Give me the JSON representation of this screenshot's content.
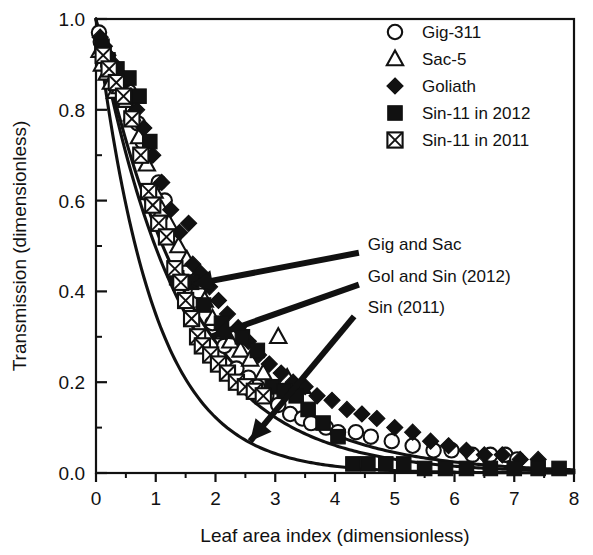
{
  "chart_data": {
    "type": "scatter",
    "title": "",
    "xlabel": "Leaf area index (dimensionless)",
    "ylabel": "Transmission (dimensionless)",
    "xlim": [
      0,
      8
    ],
    "ylim": [
      0.0,
      1.0
    ],
    "xticks": [
      0,
      1,
      2,
      3,
      4,
      5,
      6,
      7,
      8
    ],
    "xtick_labels": [
      "0",
      "1",
      "2",
      "3",
      "4",
      "5",
      "6",
      "7",
      "8"
    ],
    "yticks": [
      0.0,
      0.2,
      0.4,
      0.6,
      0.8,
      1.0
    ],
    "ytick_labels": [
      "0.0",
      "0.2",
      "0.4",
      "0.6",
      "0.8",
      "1.0"
    ],
    "x_minor_interval": 0.5,
    "y_minor_interval": 0.1,
    "grid": false,
    "legend_position": "top-right",
    "series": [
      {
        "name": "Gig-311",
        "marker": "open-circle",
        "points": [
          [
            0.05,
            0.97
          ],
          [
            0.08,
            0.95
          ],
          [
            0.12,
            0.93
          ],
          [
            0.15,
            0.91
          ],
          [
            0.22,
            0.89
          ],
          [
            0.28,
            0.88
          ],
          [
            0.35,
            0.86
          ],
          [
            0.42,
            0.87
          ],
          [
            0.55,
            0.84
          ],
          [
            0.62,
            0.8
          ],
          [
            0.7,
            0.77
          ],
          [
            0.78,
            0.73
          ],
          [
            0.88,
            0.7
          ],
          [
            1.05,
            0.64
          ],
          [
            1.15,
            0.6
          ],
          [
            1.3,
            0.52
          ],
          [
            1.55,
            0.45
          ],
          [
            1.72,
            0.4
          ],
          [
            1.95,
            0.33
          ],
          [
            2.15,
            0.28
          ],
          [
            2.35,
            0.23
          ],
          [
            2.55,
            0.21
          ],
          [
            2.7,
            0.19
          ],
          [
            2.85,
            0.17
          ],
          [
            3.05,
            0.15
          ],
          [
            3.25,
            0.13
          ],
          [
            3.45,
            0.12
          ],
          [
            3.6,
            0.11
          ],
          [
            3.85,
            0.1
          ],
          [
            4.05,
            0.09
          ],
          [
            4.35,
            0.09
          ],
          [
            4.6,
            0.08
          ],
          [
            4.95,
            0.07
          ],
          [
            5.3,
            0.06
          ],
          [
            5.65,
            0.05
          ],
          [
            5.95,
            0.05
          ],
          [
            6.3,
            0.04
          ],
          [
            6.6,
            0.04
          ],
          [
            6.85,
            0.04
          ],
          [
            7.05,
            0.03
          ]
        ]
      },
      {
        "name": "Sac-5",
        "marker": "open-triangle",
        "points": [
          [
            0.06,
            0.93
          ],
          [
            0.1,
            0.9
          ],
          [
            0.18,
            0.88
          ],
          [
            0.25,
            0.86
          ],
          [
            0.32,
            0.84
          ],
          [
            0.4,
            0.85
          ],
          [
            0.5,
            0.82
          ],
          [
            0.6,
            0.79
          ],
          [
            0.72,
            0.74
          ],
          [
            0.85,
            0.68
          ],
          [
            0.98,
            0.62
          ],
          [
            1.1,
            0.58
          ],
          [
            1.22,
            0.55
          ],
          [
            1.38,
            0.5
          ],
          [
            1.52,
            0.47
          ],
          [
            1.68,
            0.42
          ],
          [
            1.82,
            0.38
          ],
          [
            1.95,
            0.34
          ],
          [
            2.1,
            0.31
          ],
          [
            2.25,
            0.29
          ],
          [
            2.42,
            0.27
          ],
          [
            2.58,
            0.25
          ],
          [
            2.8,
            0.22
          ],
          [
            3.05,
            0.3
          ],
          [
            3.2,
            0.21
          ],
          [
            3.45,
            0.19
          ]
        ]
      },
      {
        "name": "Goliath",
        "marker": "filled-diamond",
        "points": [
          [
            0.07,
            0.96
          ],
          [
            0.14,
            0.94
          ],
          [
            0.2,
            0.92
          ],
          [
            0.3,
            0.9
          ],
          [
            0.38,
            0.88
          ],
          [
            0.48,
            0.86
          ],
          [
            0.58,
            0.83
          ],
          [
            0.68,
            0.8
          ],
          [
            0.8,
            0.76
          ],
          [
            0.95,
            0.7
          ],
          [
            1.1,
            0.64
          ],
          [
            1.25,
            0.58
          ],
          [
            1.4,
            0.53
          ],
          [
            1.55,
            0.55
          ],
          [
            1.62,
            0.46
          ],
          [
            1.75,
            0.44
          ],
          [
            1.9,
            0.41
          ],
          [
            2.05,
            0.38
          ],
          [
            2.2,
            0.35
          ],
          [
            2.38,
            0.32
          ],
          [
            2.55,
            0.29
          ],
          [
            2.72,
            0.26
          ],
          [
            2.9,
            0.24
          ],
          [
            3.1,
            0.22
          ],
          [
            3.3,
            0.2
          ],
          [
            3.5,
            0.19
          ],
          [
            3.7,
            0.17
          ],
          [
            3.95,
            0.16
          ],
          [
            4.2,
            0.14
          ],
          [
            4.45,
            0.13
          ],
          [
            4.7,
            0.12
          ],
          [
            5.0,
            0.1
          ],
          [
            5.3,
            0.09
          ],
          [
            5.6,
            0.07
          ],
          [
            5.9,
            0.06
          ],
          [
            6.2,
            0.05
          ],
          [
            6.5,
            0.04
          ],
          [
            6.8,
            0.04
          ],
          [
            7.1,
            0.03
          ],
          [
            7.4,
            0.03
          ]
        ]
      },
      {
        "name": "Sin-11 in 2012",
        "marker": "filled-square",
        "points": [
          [
            0.1,
            0.94
          ],
          [
            0.2,
            0.91
          ],
          [
            0.35,
            0.89
          ],
          [
            0.55,
            0.87
          ],
          [
            0.72,
            0.83
          ],
          [
            0.9,
            0.73
          ],
          [
            1.35,
            0.43
          ],
          [
            1.6,
            0.42
          ],
          [
            1.8,
            0.37
          ],
          [
            2.1,
            0.33
          ],
          [
            2.45,
            0.3
          ],
          [
            2.7,
            0.27
          ],
          [
            2.95,
            0.19
          ],
          [
            3.15,
            0.18
          ],
          [
            3.35,
            0.17
          ],
          [
            3.55,
            0.14
          ],
          [
            3.8,
            0.11
          ],
          [
            4.05,
            0.08
          ],
          [
            4.3,
            0.02
          ],
          [
            4.55,
            0.02
          ],
          [
            4.85,
            0.02
          ],
          [
            5.15,
            0.02
          ],
          [
            5.5,
            0.01
          ],
          [
            5.85,
            0.01
          ],
          [
            6.2,
            0.01
          ],
          [
            6.6,
            0.01
          ],
          [
            7.0,
            0.01
          ],
          [
            7.4,
            0.01
          ],
          [
            7.75,
            0.01
          ]
        ]
      },
      {
        "name": "Sin-11 in 2011",
        "marker": "crossed-square",
        "points": [
          [
            0.12,
            0.92
          ],
          [
            0.22,
            0.89
          ],
          [
            0.34,
            0.86
          ],
          [
            0.46,
            0.83
          ],
          [
            0.6,
            0.78
          ],
          [
            0.75,
            0.7
          ],
          [
            0.88,
            0.62
          ],
          [
            0.95,
            0.59
          ],
          [
            1.05,
            0.55
          ],
          [
            1.18,
            0.52
          ],
          [
            1.32,
            0.45
          ],
          [
            1.42,
            0.42
          ],
          [
            1.5,
            0.38
          ],
          [
            1.6,
            0.34
          ],
          [
            1.7,
            0.3
          ],
          [
            1.78,
            0.28
          ],
          [
            1.92,
            0.26
          ],
          [
            2.05,
            0.24
          ],
          [
            2.2,
            0.22
          ],
          [
            2.35,
            0.2
          ],
          [
            2.5,
            0.19
          ],
          [
            2.65,
            0.18
          ],
          [
            2.8,
            0.17
          ]
        ]
      }
    ],
    "fit_curves": [
      {
        "name": "Gig and Sac",
        "annotation": "Gig and Sac",
        "k": 0.62,
        "description": "upper exponential extinction curve"
      },
      {
        "name": "Gol and Sin (2012)",
        "annotation": "Gol and Sin (2012)",
        "k": 0.7,
        "description": "middle exponential extinction curve"
      },
      {
        "name": "Sin (2011)",
        "annotation": "Sin (2011)",
        "k": 1.05,
        "description": "lower steep exponential extinction curve"
      }
    ],
    "annotations": [
      {
        "text": "Gig and Sac",
        "x": 4.55,
        "y": 0.505
      },
      {
        "text": "Gol and Sin (2012)",
        "x": 4.55,
        "y": 0.435
      },
      {
        "text": "Sin (2011)",
        "x": 4.55,
        "y": 0.365
      }
    ]
  },
  "legend": {
    "entries": [
      {
        "label": "Gig-311",
        "marker": "open-circle"
      },
      {
        "label": "Sac-5",
        "marker": "open-triangle"
      },
      {
        "label": "Goliath",
        "marker": "filled-diamond"
      },
      {
        "label": "Sin-11 in 2012",
        "marker": "filled-square"
      },
      {
        "label": "Sin-11 in 2011",
        "marker": "crossed-square"
      }
    ]
  },
  "colors": {
    "ink": "#111111",
    "background": "#ffffff"
  }
}
